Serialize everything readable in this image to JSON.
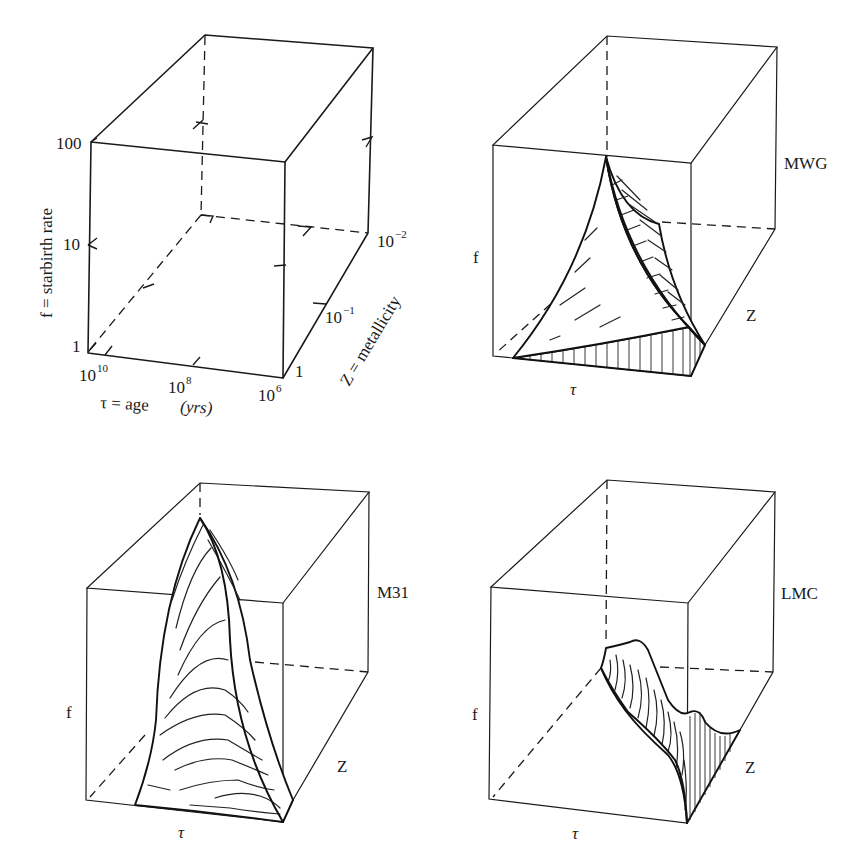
{
  "figure": {
    "panels": [
      {
        "id": "axes-key",
        "axes": {
          "f_label": "f = starbirth rate",
          "tau_label": "τ = age (yrs)",
          "tau_label_prefix": "τ = age ",
          "tau_label_unit": "(yrs)",
          "z_label": "Z = metallicity",
          "f_ticks": [
            "1",
            "10",
            "100"
          ],
          "tau_ticks": [
            "10",
            "10",
            "10"
          ],
          "tau_tick_exponents": [
            "10",
            "8",
            "6"
          ],
          "z_ticks": [
            "1",
            "10",
            "10"
          ],
          "z_tick_exponents": [
            "",
            "−1",
            "−2"
          ]
        }
      },
      {
        "id": "mwg",
        "name": "MWG",
        "f_label": "f",
        "tau_label": "τ",
        "z_label": "Z"
      },
      {
        "id": "m31",
        "name": "M31",
        "f_label": "f",
        "tau_label": "τ",
        "z_label": "Z"
      },
      {
        "id": "lmc",
        "name": "LMC",
        "f_label": "f",
        "tau_label": "τ",
        "z_label": "Z"
      }
    ],
    "colors": {
      "ink": "#1a1a1a",
      "background": "#ffffff"
    }
  }
}
